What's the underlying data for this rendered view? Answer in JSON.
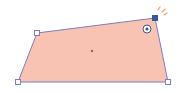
{
  "shape": {
    "type": "quadrilateral",
    "fill": "#f9c3b4",
    "stroke": "#7c7fb8",
    "points": [
      [
        37,
        33
      ],
      [
        155,
        18
      ],
      [
        168,
        82
      ],
      [
        18,
        82
      ]
    ],
    "center": [
      92,
      51
    ]
  },
  "handles": {
    "vertex_fill": "#ffffff",
    "vertex_stroke": "#7c7fb8",
    "active_vertex_fill": "#3b5998",
    "active_index": 1
  },
  "rotate_handle": {
    "x": 147,
    "y": 29,
    "color": "#3b5998"
  },
  "highlight_ticks_color": "#f0a060"
}
